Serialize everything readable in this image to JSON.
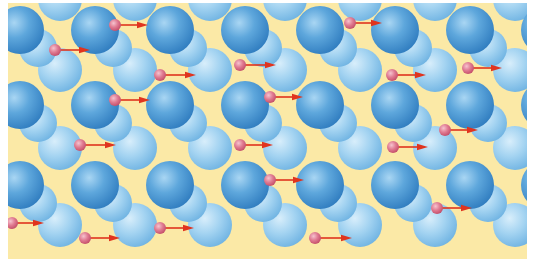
{
  "figure": {
    "background_color": "#fbe9a6",
    "ion_color_dark": "#3f8fcf",
    "ion_color_light": "#8ec8ec",
    "electron_color": "#d9607a",
    "arrow_color": "#e0341e",
    "ion_pairs": {
      "description": "Large foreground ions with a smaller ion offset behind to the lower right",
      "x_centers": [
        12,
        87,
        162,
        237,
        312,
        387,
        462,
        537
      ],
      "y_centers": [
        27,
        102,
        182
      ],
      "big_radius": 24,
      "small_radius": 19,
      "small_offset": [
        18,
        18
      ]
    },
    "ion_singles": {
      "description": "Single lighter ions between rows",
      "x_centers": [
        52,
        127,
        202,
        277,
        352,
        427,
        507
      ],
      "y_centers": [
        -4,
        67,
        145,
        222
      ],
      "radius": 22
    },
    "electrons": [
      {
        "x": 107,
        "y": 22,
        "arrow_to": 140
      },
      {
        "x": 47,
        "y": 47,
        "arrow_to": 82
      },
      {
        "x": 152,
        "y": 72,
        "arrow_to": 188
      },
      {
        "x": 232,
        "y": 62,
        "arrow_to": 268
      },
      {
        "x": 342,
        "y": 20,
        "arrow_to": 374
      },
      {
        "x": 384,
        "y": 72,
        "arrow_to": 418
      },
      {
        "x": 460,
        "y": 65,
        "arrow_to": 494
      },
      {
        "x": 107,
        "y": 97,
        "arrow_to": 142
      },
      {
        "x": 72,
        "y": 142,
        "arrow_to": 108
      },
      {
        "x": 232,
        "y": 142,
        "arrow_to": 265
      },
      {
        "x": 262,
        "y": 94,
        "arrow_to": 295
      },
      {
        "x": 385,
        "y": 144,
        "arrow_to": 420
      },
      {
        "x": 437,
        "y": 127,
        "arrow_to": 470
      },
      {
        "x": 4,
        "y": 220,
        "arrow_to": 36
      },
      {
        "x": 77,
        "y": 235,
        "arrow_to": 112
      },
      {
        "x": 152,
        "y": 225,
        "arrow_to": 186
      },
      {
        "x": 262,
        "y": 177,
        "arrow_to": 296
      },
      {
        "x": 307,
        "y": 235,
        "arrow_to": 344
      },
      {
        "x": 429,
        "y": 205,
        "arrow_to": 464
      }
    ]
  }
}
